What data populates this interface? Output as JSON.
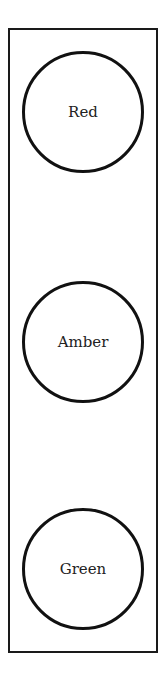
{
  "diagram": {
    "type": "traffic-light",
    "lights": [
      {
        "label": "Red"
      },
      {
        "label": "Amber"
      },
      {
        "label": "Green"
      }
    ]
  }
}
